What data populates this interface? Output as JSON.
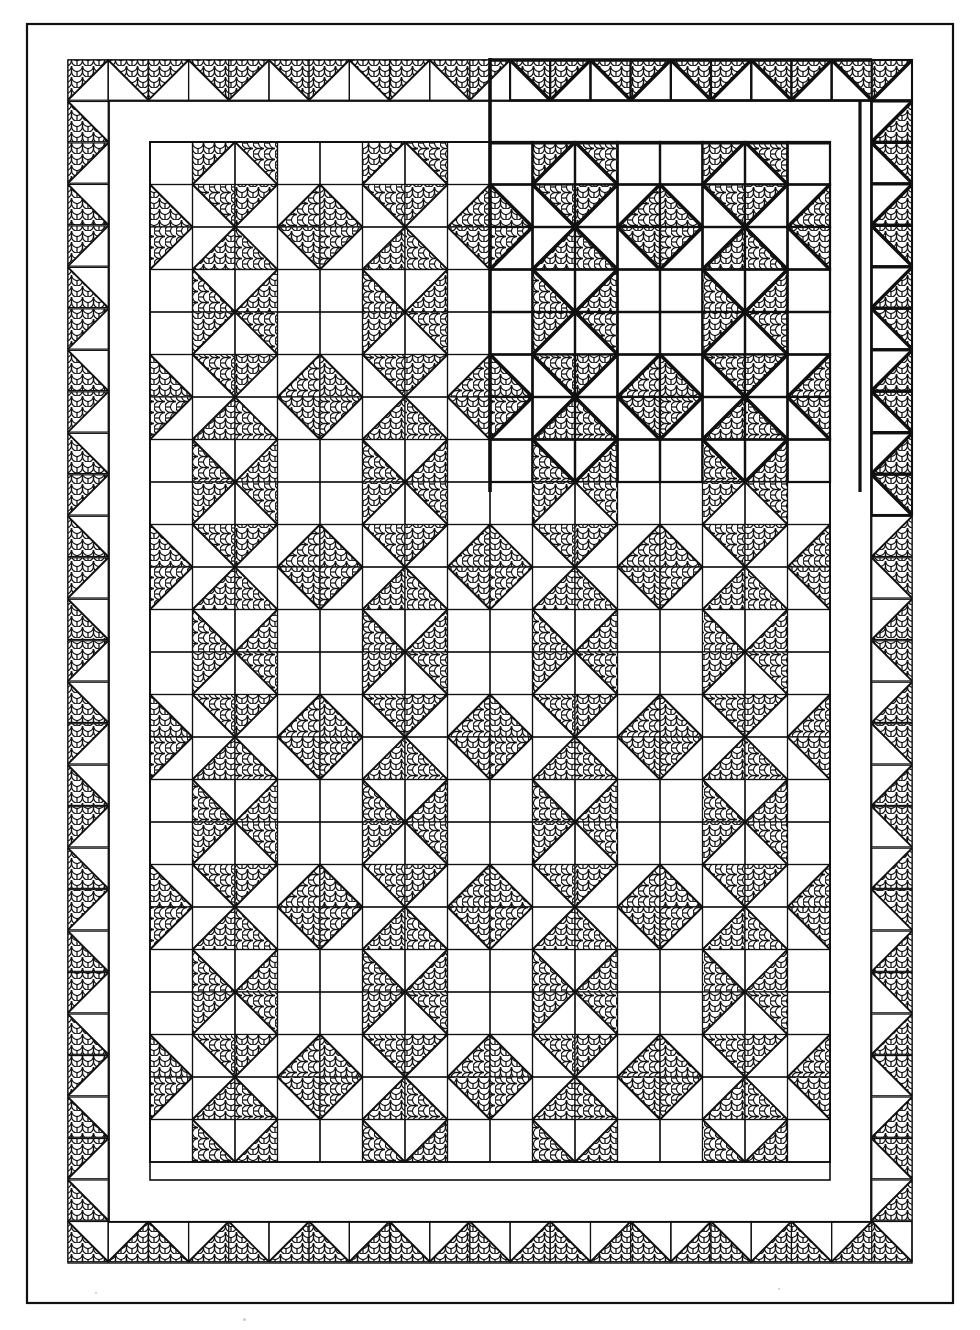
{
  "document": {
    "title": "Pieced quilt construction diagram",
    "type": "line-art-quilt-schematic",
    "ink_color": "#101010",
    "background_color": "#ffffff",
    "print_fabric_name": "clamshell-scallop-print",
    "solid_fabric_name": "plain-white"
  },
  "canvas": {
    "width": 980,
    "height": 1330
  },
  "geometry": {
    "outer_binding": {
      "x": 27,
      "y": 24,
      "width": 926,
      "height": 1279,
      "stroke": 2.2
    },
    "outer_plain_border": {
      "x": 27,
      "y": 24,
      "width": 926,
      "height": 1279,
      "band_width": 41
    },
    "outer_triangle_border": {
      "x": 68,
      "y": 60,
      "width": 844,
      "height": 1203,
      "band_width": 41,
      "unit": 41
    },
    "inner_plain_sashing": {
      "x": 109,
      "y": 101,
      "width": 762,
      "height": 1121,
      "band_width": 41
    },
    "inner_triangle_border": {
      "x": 109,
      "y": 101,
      "width": 762,
      "height": 1121
    },
    "center_field": {
      "x": 150,
      "y": 143,
      "width": 680,
      "height": 1037,
      "cell": 42.5,
      "cols": 16,
      "rows": 24
    },
    "bold_overlay_region": {
      "x": 490,
      "y": 60,
      "width": 380,
      "height": 432,
      "note": "upper-right quadrant drawn with heavier line weight"
    }
  },
  "block": {
    "name": "star-pinwheel-block",
    "grid": "4x4 half-square-triangle units",
    "unit_size_px": 42.5,
    "block_size_px": 170,
    "repeat_cols": 4,
    "repeat_rows": 6
  },
  "chart_data": {
    "type": "table",
    "legend": [
      {
        "label": "print fabric (clamshell scallop)",
        "fill": "print"
      },
      {
        "label": "plain white fabric",
        "fill": "white"
      }
    ],
    "notes": [
      "Outer plain border band",
      "Sawtooth (half-square triangle) outer border",
      "Plain inner sashing band",
      "Sawtooth inner border",
      "Center field of repeating star / pinwheel blocks",
      "Upper-right quadrant emphasized with heavier line weight"
    ]
  }
}
